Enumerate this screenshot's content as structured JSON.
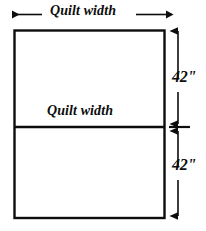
{
  "diagram": {
    "colors": {
      "line": "#0d0d0d",
      "background": "#ffffff",
      "text": "#0d0d0d"
    },
    "labels": {
      "top_width": "Quilt width",
      "inner_width": "Quilt width",
      "dimension_top": "42\"",
      "dimension_bottom": "42\""
    },
    "geometry": {
      "rect_left": 14,
      "rect_top": 30,
      "rect_right": 165,
      "rect_bottom": 218,
      "divider_y": 127,
      "dim_line_x": 178,
      "dim_top_y": 30,
      "dim_mid_y": 127,
      "dim_bottom_y": 218,
      "width_arrow_y": 14,
      "width_arrow_left_x": 12,
      "width_arrow_right_x": 166
    }
  }
}
